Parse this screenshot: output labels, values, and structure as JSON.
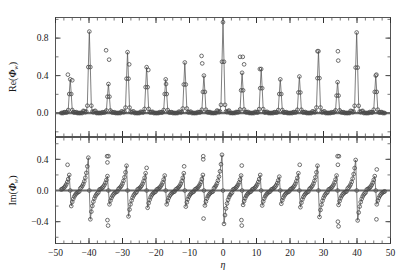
{
  "figure": {
    "name": "two-panel-spectrum",
    "xlabel": "η",
    "panels": [
      {
        "id": "upper",
        "ylabel_prefix": "Re(",
        "ylabel_symbol": "Φ",
        "ylabel_sub": "w",
        "ylabel_suffix": ")",
        "yticks": [
          0.0,
          0.4,
          0.8
        ],
        "yticklabels": [
          "0.0",
          "0.4",
          "0.8"
        ],
        "ylim": [
          -0.25,
          1.02
        ],
        "minor_y_step": 0.2
      },
      {
        "id": "lower",
        "ylabel_prefix": "Im(",
        "ylabel_symbol": "Φ",
        "ylabel_sub": "w",
        "ylabel_suffix": ")",
        "yticks": [
          -0.4,
          0.0,
          0.4
        ],
        "yticklabels": [
          "−0.4",
          "0.0",
          "0.4"
        ],
        "ylim": [
          -0.68,
          0.68
        ],
        "minor_y_step": 0.2
      }
    ],
    "xticks": [
      -50,
      -40,
      -30,
      -20,
      -10,
      0,
      10,
      20,
      30,
      40,
      50
    ],
    "xticklabels": [
      "−50",
      "−40",
      "−30",
      "−20",
      "−10",
      "0",
      "10",
      "20",
      "30",
      "40",
      "50"
    ],
    "xlim": [
      -50,
      50
    ],
    "minor_x_step": 2.5
  },
  "chart_data": {
    "type": "scatter",
    "title": "",
    "xlabel": "η",
    "ylabel": "Re(Φ_w) / Im(Φ_w)",
    "xlim": [
      -50,
      50
    ],
    "grid": false,
    "legend": null,
    "marker": "open-circle",
    "line": "thin-solid",
    "peak_spacing": 5.7,
    "peak_centers": [
      -45.6,
      -39.9,
      -34.2,
      -28.5,
      -22.8,
      -17.1,
      -11.4,
      -5.7,
      0.0,
      5.7,
      11.4,
      17.1,
      22.8,
      28.5,
      34.2,
      39.9,
      45.6
    ],
    "series": [
      {
        "name": "Re(Φ_w)",
        "panel": "upper",
        "ylim": [
          -0.25,
          1.02
        ],
        "peak_amplitudes": [
          0.36,
          0.87,
          0.31,
          0.65,
          0.49,
          0.36,
          0.54,
          0.4,
          0.97,
          0.43,
          0.47,
          0.36,
          0.39,
          0.66,
          0.33,
          0.86,
          0.4
        ],
        "trough_amplitudes": [
          -0.11,
          -0.16,
          -0.12,
          -0.15,
          -0.11,
          -0.1,
          -0.12,
          -0.13,
          -0.18,
          -0.14,
          -0.1,
          -0.09,
          -0.12,
          -0.13,
          -0.13,
          -0.16,
          -0.1
        ],
        "outlier_points": [
          {
            "x": -46.3,
            "y": 0.41
          },
          {
            "x": -45.0,
            "y": 0.35
          },
          {
            "x": -34.9,
            "y": 0.67
          },
          {
            "x": -34.0,
            "y": 0.57
          },
          {
            "x": -28.0,
            "y": 0.52
          },
          {
            "x": -22.3,
            "y": 0.46
          },
          {
            "x": -17.0,
            "y": 0.31
          },
          {
            "x": -6.4,
            "y": 0.61
          },
          {
            "x": -6.2,
            "y": 0.53
          },
          {
            "x": 5.1,
            "y": 0.6
          },
          {
            "x": 5.9,
            "y": 0.6
          },
          {
            "x": 6.3,
            "y": 0.52
          },
          {
            "x": 11.0,
            "y": 0.47
          },
          {
            "x": 28.2,
            "y": 0.66
          },
          {
            "x": 34.3,
            "y": 0.66
          },
          {
            "x": 34.4,
            "y": 0.56
          },
          {
            "x": 45.8,
            "y": 0.41
          }
        ]
      },
      {
        "name": "Im(Φ_w)",
        "panel": "lower",
        "ylim": [
          -0.68,
          0.68
        ],
        "peak_amplitudes": [
          0.27,
          0.57,
          0.25,
          0.43,
          0.3,
          0.26,
          0.3,
          0.27,
          0.62,
          0.26,
          0.27,
          0.24,
          0.3,
          0.43,
          0.26,
          0.53,
          0.25
        ],
        "trough_amplitudes": [
          -0.27,
          -0.5,
          -0.24,
          -0.45,
          -0.3,
          -0.24,
          -0.28,
          -0.26,
          -0.58,
          -0.25,
          -0.26,
          -0.23,
          -0.29,
          -0.46,
          -0.25,
          -0.52,
          -0.24
        ],
        "outlier_points": [
          {
            "x": -46.4,
            "y": 0.33
          },
          {
            "x": -34.6,
            "y": 0.44
          },
          {
            "x": -34.2,
            "y": 0.44
          },
          {
            "x": -34.5,
            "y": 0.36
          },
          {
            "x": -22.8,
            "y": 0.29
          },
          {
            "x": -11.6,
            "y": 0.31
          },
          {
            "x": -5.9,
            "y": 0.44
          },
          {
            "x": -5.9,
            "y": 0.4
          },
          {
            "x": 5.6,
            "y": 0.32
          },
          {
            "x": 22.9,
            "y": 0.33
          },
          {
            "x": 34.2,
            "y": 0.44
          },
          {
            "x": 34.6,
            "y": 0.44
          },
          {
            "x": 34.3,
            "y": 0.33
          },
          {
            "x": 45.9,
            "y": 0.27
          },
          {
            "x": -34.5,
            "y": -0.38
          },
          {
            "x": -34.3,
            "y": -0.45
          },
          {
            "x": -5.8,
            "y": -0.36
          },
          {
            "x": 5.5,
            "y": -0.38
          },
          {
            "x": 5.6,
            "y": -0.45
          },
          {
            "x": 34.3,
            "y": -0.4
          },
          {
            "x": 34.5,
            "y": -0.46
          },
          {
            "x": 45.8,
            "y": -0.37
          }
        ]
      }
    ]
  }
}
